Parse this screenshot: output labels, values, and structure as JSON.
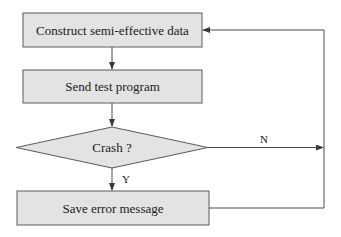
{
  "diagram": {
    "type": "flowchart",
    "colors": {
      "node_fill": "#e3e3e3",
      "node_stroke": "#5a5a5a",
      "edge_stroke": "#4a4a4a",
      "text": "#1a1a1a",
      "background": "#ffffff"
    },
    "nodes": [
      {
        "id": "construct",
        "shape": "rectangle",
        "label": "Construct semi-effective data"
      },
      {
        "id": "send",
        "shape": "rectangle",
        "label": "Send test program"
      },
      {
        "id": "crash",
        "shape": "diamond",
        "label": "Crash ?"
      },
      {
        "id": "save",
        "shape": "rectangle",
        "label": "Save error message"
      }
    ],
    "edges": [
      {
        "from": "construct",
        "to": "send",
        "label": ""
      },
      {
        "from": "send",
        "to": "crash",
        "label": ""
      },
      {
        "from": "crash",
        "to": "save",
        "label": "Y"
      },
      {
        "from": "crash",
        "to": "construct",
        "label": "N"
      },
      {
        "from": "save",
        "to": "construct",
        "label": ""
      }
    ]
  }
}
